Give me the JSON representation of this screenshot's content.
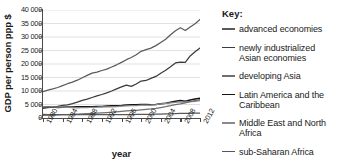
{
  "chart_data": {
    "type": "line",
    "title": "",
    "xlabel": "year",
    "ylabel": "GDP per person ppp $",
    "xlim": [
      1980,
      2012
    ],
    "ylim": [
      0,
      40000
    ],
    "grid": true,
    "legend_position": "right",
    "legend_title": "Key:",
    "ytick_labels": [
      "0",
      "5 000",
      "10 000",
      "15 000",
      "20 000",
      "25 000",
      "30 000",
      "35 000",
      "40 000"
    ],
    "ytick_values": [
      0,
      5000,
      10000,
      15000,
      20000,
      25000,
      30000,
      35000,
      40000
    ],
    "xtick_labels": [
      "1980",
      "1984",
      "1988",
      "1992",
      "1996",
      "2000",
      "2004",
      "2008",
      "2012"
    ],
    "xtick_values": [
      1980,
      1984,
      1988,
      1992,
      1996,
      2000,
      2004,
      2008,
      2012
    ],
    "x": [
      1980,
      1981,
      1982,
      1983,
      1984,
      1985,
      1986,
      1987,
      1988,
      1989,
      1990,
      1991,
      1992,
      1993,
      1994,
      1995,
      1996,
      1997,
      1998,
      1999,
      2000,
      2001,
      2002,
      2003,
      2004,
      2005,
      2006,
      2007,
      2008,
      2009,
      2010,
      2011,
      2012
    ],
    "series": [
      {
        "name": "advanced economies",
        "color": "#5a5a5a",
        "width": 1.25,
        "values": [
          9800,
          10300,
          10750,
          11300,
          12000,
          12700,
          13300,
          14000,
          14900,
          15800,
          16600,
          17000,
          17600,
          18100,
          18900,
          19700,
          20600,
          21600,
          22400,
          23400,
          24700,
          25300,
          25900,
          26800,
          28000,
          29200,
          30800,
          32300,
          33400,
          32400,
          33700,
          34900,
          36500
        ]
      },
      {
        "name": "newly industrialized Asian economies",
        "color": "#3b3b3b",
        "width": 1.25,
        "values": [
          3600,
          3800,
          4000,
          4300,
          4700,
          4900,
          5300,
          5900,
          6500,
          7000,
          7600,
          8200,
          8700,
          9300,
          10000,
          10800,
          11500,
          12200,
          11700,
          12600,
          13700,
          13900,
          14700,
          15400,
          16600,
          17700,
          19000,
          20400,
          20700,
          20600,
          23000,
          24500,
          25900
        ]
      },
      {
        "name": "Latin America and the Caribbean",
        "color": "#141414",
        "width": 1.5,
        "values": [
          4050,
          4150,
          4050,
          3900,
          3980,
          4050,
          4100,
          4180,
          4180,
          4200,
          4150,
          4250,
          4300,
          4400,
          4520,
          4550,
          4650,
          4850,
          4900,
          4880,
          5000,
          4980,
          4950,
          5000,
          5250,
          5500,
          5850,
          6200,
          6450,
          6250,
          6650,
          7000,
          7300
        ]
      },
      {
        "name": "Middle East and North Africa",
        "color": "#8a8a8a",
        "width": 1.25,
        "values": [
          4250,
          4150,
          4100,
          4050,
          4000,
          3950,
          3800,
          3780,
          3820,
          3880,
          3980,
          4000,
          4080,
          4100,
          4150,
          4250,
          4380,
          4480,
          4550,
          4600,
          4750,
          4800,
          4850,
          4980,
          5200,
          5400,
          5600,
          5800,
          5980,
          5900,
          6050,
          6200,
          6400
        ]
      },
      {
        "name": "developing Asia",
        "color": "#6e6e6e",
        "width": 1.25,
        "values": [
          1000,
          1030,
          1080,
          1140,
          1210,
          1290,
          1360,
          1450,
          1550,
          1620,
          1680,
          1770,
          1900,
          2030,
          2170,
          2310,
          2460,
          2600,
          2720,
          2850,
          3010,
          3160,
          3340,
          3580,
          3870,
          4180,
          4550,
          4960,
          5250,
          5600,
          6050,
          6450,
          6800
        ]
      },
      {
        "name": "sub-Saharan Africa",
        "color": "#575757",
        "width": 1.25,
        "values": [
          1300,
          1290,
          1270,
          1230,
          1220,
          1230,
          1230,
          1230,
          1250,
          1260,
          1260,
          1250,
          1230,
          1220,
          1220,
          1230,
          1260,
          1280,
          1290,
          1300,
          1320,
          1350,
          1370,
          1400,
          1450,
          1510,
          1570,
          1640,
          1700,
          1690,
          1740,
          1790,
          1840
        ]
      }
    ]
  },
  "legend": {
    "title": "Key:",
    "items": [
      {
        "label": "advanced economies"
      },
      {
        "label": "newly industrialized Asian economies"
      },
      {
        "label": "developing Asia"
      },
      {
        "label": "Latin America and the Caribbean"
      },
      {
        "label": "Middle East and North Africa"
      },
      {
        "label": "sub-Saharan Africa"
      }
    ]
  }
}
